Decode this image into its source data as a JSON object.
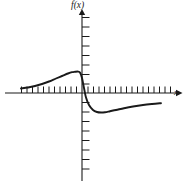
{
  "figure": {
    "background_color": "#ffffff",
    "ink_color": "#1a1a1a"
  },
  "labels": {
    "y_axis": "f(x)",
    "x_axis": "x"
  },
  "chart_data": {
    "type": "line",
    "title": "",
    "xlabel": "x",
    "ylabel": "f(x)",
    "grid": false,
    "legend": null,
    "axes": {
      "origin_px": [
        82,
        93
      ],
      "x_axis_range_px": [
        5,
        178
      ],
      "y_axis_range_px": [
        11,
        181
      ],
      "x_tick_count_left": 11,
      "x_tick_count_right": 17,
      "y_tick_count_up": 8,
      "y_tick_count_down": 8,
      "x_tick_spacing_px": 5.5,
      "y_tick_spacing_px": 9.5,
      "x_arrow": "right",
      "y_arrow": "up"
    },
    "annotations": [
      "curve approaches zero from above on the far left",
      "local maximum just left of the y-axis",
      "steep descent crossing the x-axis near the origin",
      "local minimum just right of the y-axis",
      "curve approaches zero from below on the far right"
    ],
    "x": [
      21,
      28,
      35,
      42,
      49,
      56,
      62,
      68,
      72,
      75,
      78,
      80,
      82,
      84,
      86,
      89,
      93,
      97,
      101,
      105,
      110,
      116,
      124,
      133,
      143,
      152,
      161
    ],
    "y": [
      88.5,
      87.5,
      86.0,
      84.0,
      81.5,
      78.5,
      76.0,
      73.5,
      72.2,
      71.8,
      71.6,
      72.6,
      78.0,
      88.0,
      97.5,
      105.0,
      110.0,
      112.0,
      112.5,
      112.2,
      111.2,
      110.0,
      108.2,
      106.5,
      105.0,
      104.0,
      103.2
    ],
    "series": [
      {
        "name": "f(x)",
        "description": "odd dispersion-shaped curve with a positive lobe left of the origin and a negative lobe right of the origin",
        "peak": {
          "x_px": 78,
          "y_px": 71.6
        },
        "trough": {
          "x_px": 102,
          "y_px": 112.5
        },
        "zero_crossing": {
          "x_px": 83,
          "y_px": 93
        }
      }
    ]
  }
}
